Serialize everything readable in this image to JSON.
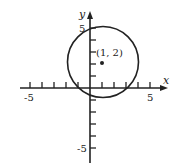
{
  "diagram": {
    "type": "circle-on-coordinate-plane",
    "x_axis_label": "x",
    "y_axis_label": "y",
    "x_tick_labels": {
      "neg": "-5",
      "pos": "5"
    },
    "y_tick_labels": {
      "pos": "5",
      "neg": "-5"
    },
    "center_label": "(1, 2)",
    "center": [
      1,
      2
    ],
    "radius": 3,
    "x_range": [
      -6,
      6
    ],
    "y_range": [
      -6,
      6
    ],
    "ink_color": "#222222"
  }
}
